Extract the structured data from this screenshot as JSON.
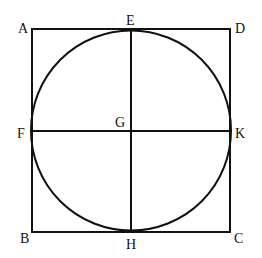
{
  "diagram": {
    "title": "",
    "square": {
      "x1": 32,
      "y1": 29,
      "x2": 230,
      "y2": 232
    },
    "circle": {
      "cx": 131,
      "cy": 130.5,
      "r": 100
    },
    "lines": [
      {
        "name": "EH",
        "x1": 131,
        "y1": 29,
        "x2": 131,
        "y2": 232
      },
      {
        "name": "FK",
        "x1": 32,
        "y1": 131,
        "x2": 230,
        "y2": 131
      }
    ],
    "labels": {
      "A": "A",
      "B": "B",
      "C": "C",
      "D": "D",
      "E": "E",
      "F": "F",
      "G": "G",
      "H": "H",
      "K": "K"
    },
    "stroke_color": "#111111"
  }
}
